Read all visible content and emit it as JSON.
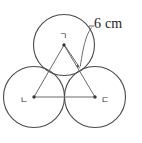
{
  "figure": {
    "background_color": "#ffffff",
    "stroke_color": "#4a4a4a",
    "triangle_stroke_color": "#6b6b6b",
    "dimension": {
      "value": "6 cm",
      "measures": "radius",
      "label_x": 94,
      "label_y": 23
    },
    "circles": [
      {
        "id": "top",
        "label": "ㄱ",
        "cx": 64,
        "cy": 45,
        "r": 31,
        "label_dx": -5,
        "label_dy": -6
      },
      {
        "id": "left",
        "label": "ㄴ",
        "cx": 34,
        "cy": 97,
        "r": 31,
        "label_dx": -14,
        "label_dy": 6
      },
      {
        "id": "right",
        "label": "ㄷ",
        "cx": 95,
        "cy": 97,
        "r": 31,
        "label_dx": 6,
        "label_dy": 6
      }
    ],
    "triangle": {
      "vertices": [
        [
          64,
          45
        ],
        [
          34,
          97
        ],
        [
          95,
          97
        ]
      ],
      "side_label": ""
    },
    "radius_arrow": {
      "from": [
        64,
        45
      ],
      "to": [
        80,
        68
      ]
    },
    "leader": {
      "start": [
        92,
        27
      ],
      "end": [
        80,
        66
      ]
    }
  }
}
